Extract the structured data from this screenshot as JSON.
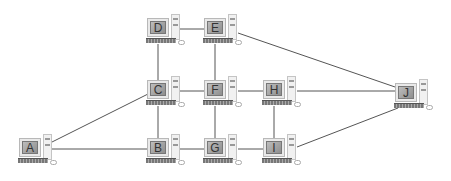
{
  "diagram": {
    "type": "network-topology",
    "line_color": "#555555",
    "nodes": [
      {
        "id": "A",
        "label": "A",
        "x": 19,
        "y": 134
      },
      {
        "id": "B",
        "label": "B",
        "x": 147,
        "y": 134
      },
      {
        "id": "C",
        "label": "C",
        "x": 147,
        "y": 76
      },
      {
        "id": "D",
        "label": "D",
        "x": 147,
        "y": 14
      },
      {
        "id": "E",
        "label": "E",
        "x": 204,
        "y": 14
      },
      {
        "id": "F",
        "label": "F",
        "x": 204,
        "y": 76
      },
      {
        "id": "G",
        "label": "G",
        "x": 204,
        "y": 134
      },
      {
        "id": "H",
        "label": "H",
        "x": 263,
        "y": 76
      },
      {
        "id": "I",
        "label": "I",
        "x": 263,
        "y": 134
      },
      {
        "id": "J",
        "label": "J",
        "x": 395,
        "y": 79
      }
    ],
    "edges": [
      [
        "A",
        "B"
      ],
      [
        "A",
        "C"
      ],
      [
        "B",
        "C"
      ],
      [
        "B",
        "G"
      ],
      [
        "C",
        "D"
      ],
      [
        "C",
        "F"
      ],
      [
        "D",
        "E"
      ],
      [
        "E",
        "F"
      ],
      [
        "E",
        "J"
      ],
      [
        "F",
        "G"
      ],
      [
        "F",
        "H"
      ],
      [
        "G",
        "I"
      ],
      [
        "H",
        "I"
      ],
      [
        "H",
        "J"
      ],
      [
        "I",
        "J"
      ]
    ]
  }
}
